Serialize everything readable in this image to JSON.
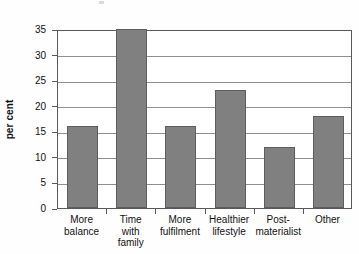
{
  "chart_data": {
    "type": "bar",
    "title": "",
    "xlabel": "",
    "ylabel": "per cent",
    "ylim": [
      0,
      35
    ],
    "ytick_step": 5,
    "grid": true,
    "legend": "none",
    "bar_color": "#808080",
    "bar_border_color": "#5d5d5d",
    "axis_color": "#58595b",
    "categories": [
      "More balance",
      "Time with family",
      "More fulfilment",
      "Healthier lifestyle",
      "Post-materialist",
      "Other"
    ],
    "category_lines": [
      [
        "More",
        "balance"
      ],
      [
        "Time",
        "with",
        "family"
      ],
      [
        "More",
        "fulfilment"
      ],
      [
        "Healthier",
        "lifestyle"
      ],
      [
        "Post-",
        "materialist"
      ],
      [
        "Other"
      ]
    ],
    "values": [
      16,
      35,
      16,
      23,
      12,
      18
    ],
    "yticks": [
      0,
      5,
      10,
      15,
      20,
      25,
      30,
      35
    ],
    "ytick_labels": [
      "0",
      "5",
      "10",
      "15",
      "20",
      "25",
      "30",
      "35"
    ]
  }
}
